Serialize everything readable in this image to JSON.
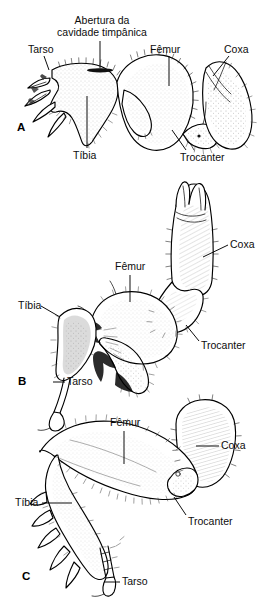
{
  "figure": {
    "type": "scientific-illustration",
    "language": "pt-BR",
    "background_color": "#ffffff",
    "ink_color": "#000000",
    "cropped_top_text": "",
    "panels": [
      {
        "id": "A",
        "letter": "A",
        "letter_pos": {
          "x": 17,
          "y": 128
        },
        "labels": [
          {
            "name": "tympanic-cavity-opening",
            "text": "Abertura da\ncavidade timpânica",
            "line1": "Abertura da",
            "line2": "cavidade timpânica",
            "x": 52,
            "y": 14,
            "w": 100,
            "leader": {
              "x1": 100,
              "y1": 41,
              "x2": 100,
              "y2": 68
            }
          },
          {
            "name": "tarsus",
            "text": "Tarso",
            "x": 28,
            "y": 44,
            "leader": {
              "x1": 44,
              "y1": 56,
              "x2": 49,
              "y2": 69
            }
          },
          {
            "name": "femur",
            "text": "Fêmur",
            "x": 150,
            "y": 44,
            "leader": {
              "x1": 169,
              "y1": 56,
              "x2": 169,
              "y2": 84
            }
          },
          {
            "name": "coxa",
            "text": "Coxa",
            "x": 224,
            "y": 44,
            "leader": {
              "x1": 228,
              "y1": 56,
              "x2": 212,
              "y2": 76
            }
          },
          {
            "name": "tibia",
            "text": "Tíbia",
            "x": 73,
            "y": 150,
            "leader": {
              "x1": 87,
              "y1": 148,
              "x2": 87,
              "y2": 96
            }
          },
          {
            "name": "trochanter",
            "text": "Trocanter",
            "x": 180,
            "y": 152,
            "leader": {
              "x1": 186,
              "y1": 150,
              "x2": 172,
              "y2": 128
            }
          }
        ]
      },
      {
        "id": "B",
        "letter": "B",
        "letter_pos": {
          "x": 18,
          "y": 380
        },
        "labels": [
          {
            "name": "coxa",
            "text": "Coxa",
            "x": 230,
            "y": 240,
            "leader": {
              "x1": 228,
              "y1": 245,
              "x2": 205,
              "y2": 257
            }
          },
          {
            "name": "femur",
            "text": "Fêmur",
            "x": 115,
            "y": 262,
            "leader": {
              "x1": 130,
              "y1": 274,
              "x2": 130,
              "y2": 300
            }
          },
          {
            "name": "tibia",
            "text": "Tíbia",
            "x": 18,
            "y": 303,
            "leader": {
              "x1": 40,
              "y1": 309,
              "x2": 58,
              "y2": 318
            }
          },
          {
            "name": "trochanter",
            "text": "Trocanter",
            "x": 201,
            "y": 343,
            "leader": {
              "x1": 199,
              "y1": 341,
              "x2": 186,
              "y2": 325
            }
          },
          {
            "name": "tarsus",
            "text": "Tarso",
            "x": 67,
            "y": 379,
            "leader": {
              "x1": 65,
              "y1": 383,
              "x2": 53,
              "y2": 383
            }
          }
        ]
      },
      {
        "id": "C",
        "letter": "C",
        "letter_pos": {
          "x": 22,
          "y": 573
        },
        "labels": [
          {
            "name": "femur",
            "text": "Fêmur",
            "x": 110,
            "y": 418,
            "leader": {
              "x1": 124,
              "y1": 430,
              "x2": 124,
              "y2": 462
            }
          },
          {
            "name": "coxa",
            "text": "Coxa",
            "x": 221,
            "y": 441,
            "leader": {
              "x1": 219,
              "y1": 446,
              "x2": 198,
              "y2": 446
            }
          },
          {
            "name": "tibia",
            "text": "Tíbia",
            "x": 15,
            "y": 498,
            "leader": {
              "x1": 40,
              "y1": 503,
              "x2": 70,
              "y2": 503
            }
          },
          {
            "name": "trochanter",
            "text": "Trocanter",
            "x": 188,
            "y": 517,
            "leader": {
              "x1": 186,
              "y1": 515,
              "x2": 174,
              "y2": 497
            }
          },
          {
            "name": "tarsus",
            "text": "Tarso",
            "x": 122,
            "y": 578,
            "leader": {
              "x1": 120,
              "y1": 582,
              "x2": 104,
              "y2": 582
            }
          }
        ]
      }
    ],
    "anatomical_terms": [
      "Tarso",
      "Tíbia",
      "Fêmur",
      "Trocanter",
      "Coxa",
      "Abertura da cavidade timpânica"
    ]
  }
}
